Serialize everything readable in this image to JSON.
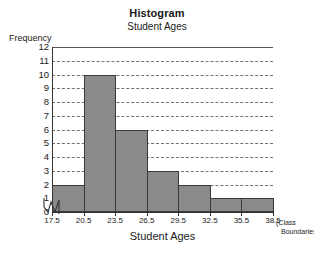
{
  "chart_data": {
    "type": "bar",
    "title": "Histogram",
    "subtitle": "Student Ages",
    "xlabel": "Student Ages",
    "ylabel": "Frequency",
    "x_axis_note_line1": "(Class",
    "x_axis_note_line2": "Boundaries)",
    "categories": [
      "17.5-20.5",
      "20.5-23.5",
      "23.5-26.5",
      "26.5-29.5",
      "29.5-32.5",
      "32.5-35.5",
      "35.5-38.5"
    ],
    "values": [
      2,
      10,
      6,
      3,
      2,
      1,
      1
    ],
    "bin_edges": [
      17.5,
      20.5,
      23.5,
      26.5,
      29.5,
      32.5,
      35.5,
      38.5
    ],
    "x_tick_labels": [
      "17.5",
      "20.5",
      "23.5",
      "26.5",
      "29.5",
      "32.5",
      "35.5",
      "38.5"
    ],
    "y_tick_labels": [
      "12",
      "11",
      "10",
      "9",
      "8",
      "7",
      "6",
      "5",
      "4",
      "3",
      "2",
      "1",
      "0"
    ],
    "y_ticks": [
      12,
      11,
      10,
      9,
      8,
      7,
      6,
      5,
      4,
      3,
      2,
      1,
      0
    ],
    "ylim": [
      0,
      12
    ],
    "xlim": [
      17.5,
      38.5
    ],
    "grid": true,
    "grid_style": "dashed-horizontal",
    "legend": false,
    "has_axis_break": true,
    "bar_fill_color": "#8a8a8a",
    "bar_border_color": "#3a3a3a",
    "grid_color": "#444444",
    "axis_color": "#333333",
    "background_color": "#ffffff"
  }
}
